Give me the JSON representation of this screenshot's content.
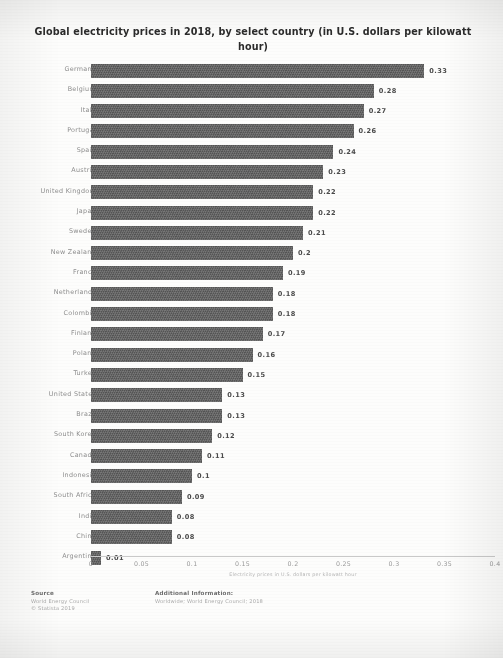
{
  "chart_title": "Global electricity prices in 2018, by select country (in U.S. dollars per kilowatt hour)",
  "axis_title": "Electricity prices in U.S. dollars per kilowatt hour",
  "colors": {
    "bar": "#5d5d5d",
    "label": "#8e8e8e",
    "value": "#4a4a4a",
    "axis": "#c9c9c9",
    "logo_bar": "#1f1f1f"
  },
  "footer": {
    "source_heading": "Source",
    "source_lines": [
      "World Energy Council",
      "© Statista 2019"
    ],
    "additional_heading": "Additional Information:",
    "additional_lines": [
      "Worldwide; World Energy Council; 2018"
    ],
    "logo_text": "statista",
    "logo_mark_name": "statista-arrow-mark"
  },
  "chart_data": {
    "type": "bar",
    "orientation": "horizontal",
    "title": "Global electricity prices in 2018, by select country (in U.S. dollars per kilowatt hour)",
    "xlabel": "Electricity prices in U.S. dollars per kilowatt hour",
    "ylabel": "",
    "xlim": [
      0,
      0.4
    ],
    "grid": false,
    "legend": false,
    "xticks": [
      "0",
      "0.05",
      "0.1",
      "0.15",
      "0.2",
      "0.25",
      "0.3",
      "0.35",
      "0.4"
    ],
    "xtick_values": [
      0,
      0.05,
      0.1,
      0.15,
      0.2,
      0.25,
      0.3,
      0.35,
      0.4
    ],
    "categories": [
      "Germany",
      "Belgium",
      "Italy",
      "Portugal",
      "Spain",
      "Austria",
      "United Kingdom",
      "Japan",
      "Sweden",
      "New Zealand",
      "France",
      "Netherlands",
      "Colombia",
      "Finland",
      "Poland",
      "Turkey",
      "United States",
      "Brazil",
      "South Korea",
      "Canada",
      "Indonesia",
      "South Africa",
      "India",
      "China",
      "Argentina"
    ],
    "values": [
      0.33,
      0.28,
      0.27,
      0.26,
      0.24,
      0.23,
      0.22,
      0.22,
      0.21,
      0.2,
      0.19,
      0.18,
      0.18,
      0.17,
      0.16,
      0.15,
      0.13,
      0.13,
      0.12,
      0.11,
      0.1,
      0.09,
      0.08,
      0.08,
      0.01
    ],
    "value_labels": [
      "0.33",
      "0.28",
      "0.27",
      "0.26",
      "0.24",
      "0.23",
      "0.22",
      "0.22",
      "0.21",
      "0.2",
      "0.19",
      "0.18",
      "0.18",
      "0.17",
      "0.16",
      "0.15",
      "0.13",
      "0.13",
      "0.12",
      "0.11",
      "0.1",
      "0.09",
      "0.08",
      "0.08",
      "0.01"
    ]
  }
}
